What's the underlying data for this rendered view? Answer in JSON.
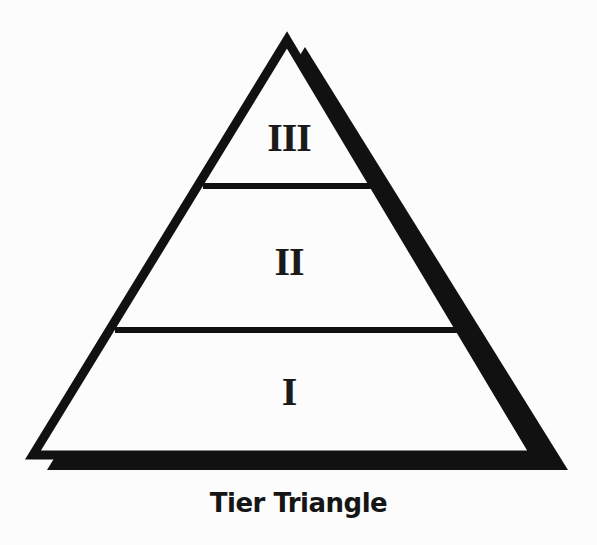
{
  "diagram": {
    "type": "pyramid",
    "caption": "Tier Triangle",
    "tiers": [
      {
        "label": "III",
        "position": "top"
      },
      {
        "label": "II",
        "position": "middle"
      },
      {
        "label": "I",
        "position": "bottom"
      }
    ],
    "colors": {
      "stroke": "#111111",
      "shadow": "#111111",
      "fill": "#fcfcfc",
      "text": "#1a1a1a"
    }
  }
}
